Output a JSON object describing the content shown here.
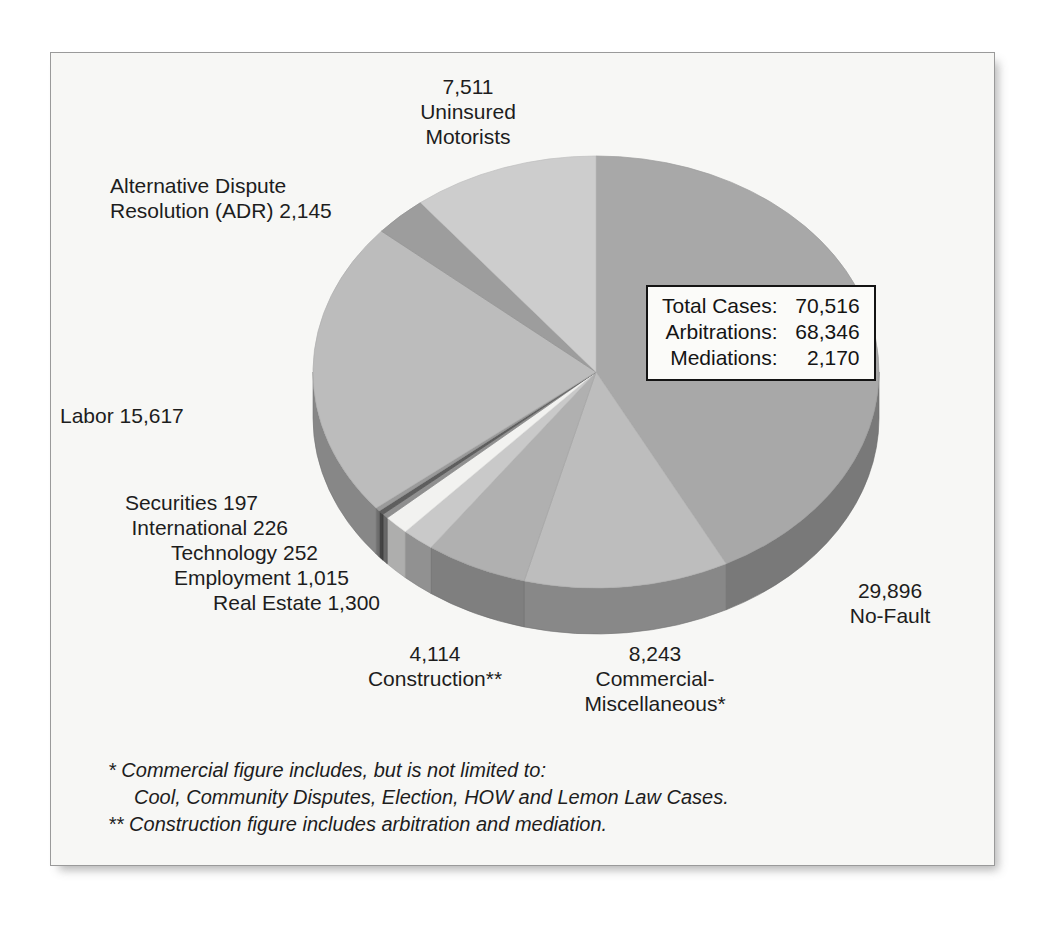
{
  "chart_data": {
    "type": "pie",
    "title": "",
    "xlabel": "",
    "ylabel": "",
    "legend_position": "inline-callouts",
    "grid": false,
    "total": 70516,
    "categories": [
      "No-Fault",
      "Commercial-Miscellaneous*",
      "Construction**",
      "Real Estate",
      "Employment",
      "Technology",
      "International",
      "Securities",
      "Labor",
      "Alternative Dispute Resolution (ADR)",
      "Uninsured Motorists"
    ],
    "values": [
      29896,
      8243,
      4114,
      1300,
      1015,
      252,
      226,
      197,
      15617,
      2145,
      7511
    ],
    "slice_colors": [
      "#a8a8a8",
      "#bdbdbd",
      "#b0b0b0",
      "#c9c9c9",
      "#f2f2f0",
      "#8f8f8f",
      "#5e5e5e",
      "#9a9a9a",
      "#bcbcbc",
      "#9d9d9d",
      "#cdcdcd"
    ]
  },
  "panel": {
    "background": "#f7f7f5",
    "border_color": "#9a9a9a"
  },
  "labels": {
    "uninsured": "7,511\nUninsured\nMotorists",
    "adr": "Alternative Dispute\nResolution (ADR) 2,145",
    "labor": "Labor 15,617",
    "nofault": "29,896\nNo-Fault",
    "construction": "4,114\nConstruction**",
    "commercial": "8,243\nCommercial-\nMiscellaneous*",
    "micro": [
      "Securities 197",
      "International 226",
      "Technology 252",
      "Employment 1,015",
      "Real Estate 1,300"
    ]
  },
  "stats_box": {
    "rows": [
      {
        "key": "Total Cases:",
        "value": "70,516"
      },
      {
        "key": "Arbitrations:",
        "value": "68,346"
      },
      {
        "key": "Mediations:",
        "value": "2,170"
      }
    ]
  },
  "footnotes": [
    "* Commercial figure includes, but is not limited to:",
    "Cool, Community Disputes, Election, HOW and Lemon Law Cases.",
    "** Construction figure includes arbitration and mediation."
  ]
}
